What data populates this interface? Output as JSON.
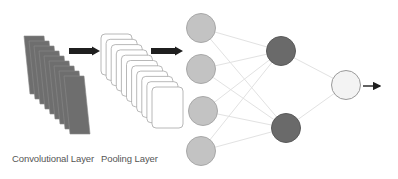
{
  "diagram": {
    "colors": {
      "conv_sheet": "#6e6e6e",
      "conv_sheet_edge": "#8a8a8a",
      "pool_card_fill": "#ffffff",
      "pool_card_stroke": "#a6a6a6",
      "arrow": "#1f1f1f",
      "input_node_fill": "#c3c3c3",
      "input_node_stroke": "#a8a8a8",
      "hidden_node_fill": "#6a6a6a",
      "hidden_node_stroke": "#5a5a5a",
      "output_node_fill": "#f3f3f3",
      "output_node_stroke": "#9a9a9a",
      "connection": "#e2e2e2",
      "label_text": "#555555"
    },
    "labels": {
      "conv": "Convolutional Layer",
      "pool": "Pooling Layer"
    },
    "conv_stack": {
      "count": 9,
      "start_x": 24,
      "start_y": 36,
      "width": 20,
      "height": 58,
      "skew": 6,
      "dx": 5,
      "dy": 5
    },
    "pool_stack": {
      "count": 11,
      "start_x": 101,
      "start_y": 34,
      "width": 31,
      "height": 41,
      "radius": 4,
      "dx": 5.1,
      "dy": 5.3
    },
    "arrows": [
      {
        "name": "conv-to-pool-arrow",
        "x1": 69,
        "x2": 100,
        "y": 51
      },
      {
        "name": "pool-to-fc-arrow",
        "x1": 151,
        "x2": 183,
        "y": 51
      }
    ],
    "output_arrow": {
      "x1": 363,
      "x2": 380,
      "y": 86
    },
    "layers": {
      "input": [
        {
          "id": "in1",
          "cx": 201,
          "cy": 28,
          "r": 14.5
        },
        {
          "id": "in2",
          "cx": 201,
          "cy": 69,
          "r": 14.5
        },
        {
          "id": "in3",
          "cx": 203,
          "cy": 111,
          "r": 14.5
        },
        {
          "id": "in4",
          "cx": 201,
          "cy": 151,
          "r": 14.5
        }
      ],
      "hidden": [
        {
          "id": "h1",
          "cx": 281,
          "cy": 51,
          "r": 14.5
        },
        {
          "id": "h2",
          "cx": 286,
          "cy": 128,
          "r": 14.5
        }
      ],
      "output": [
        {
          "id": "o1",
          "cx": 346,
          "cy": 85,
          "r": 14.5
        }
      ]
    }
  }
}
